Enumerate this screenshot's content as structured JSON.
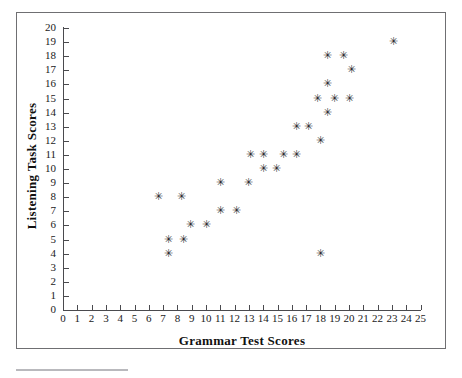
{
  "figure": {
    "background_color": "#ffffff",
    "frame_color": "#6f6f72",
    "axis_color": "#4a4a4e",
    "marker_color": "#2b2b2e",
    "marker_glyph": "✳"
  },
  "chart_data": {
    "type": "scatter",
    "title": "",
    "xlabel": "Grammar Test Scores",
    "ylabel": "Listening Task Scores",
    "xlim": [
      0,
      25
    ],
    "ylim": [
      0,
      20
    ],
    "xticks": [
      0,
      1,
      2,
      3,
      4,
      5,
      6,
      7,
      8,
      9,
      10,
      11,
      12,
      13,
      14,
      15,
      16,
      17,
      18,
      19,
      20,
      21,
      22,
      23,
      24,
      25
    ],
    "yticks": [
      0,
      1,
      2,
      3,
      4,
      5,
      6,
      7,
      8,
      9,
      10,
      11,
      12,
      13,
      14,
      15,
      16,
      17,
      18,
      19,
      20
    ],
    "xtick_labels": [
      "0",
      "1",
      "2",
      "3",
      "4",
      "5",
      "6",
      "7",
      "8",
      "9",
      "10",
      "11",
      "12",
      "13",
      "14",
      "15",
      "16",
      "17",
      "18",
      "19",
      "20",
      "21",
      "22",
      "23",
      "24",
      "25"
    ],
    "ytick_labels": [
      "0",
      "1",
      "2",
      "3",
      "4",
      "5",
      "6",
      "7",
      "8",
      "9",
      "10",
      "11",
      "12",
      "13",
      "14",
      "15",
      "16",
      "17",
      "18",
      "19",
      "20"
    ],
    "grid": false,
    "legend": null,
    "marker": "asterisk",
    "points": [
      {
        "x": 6.7,
        "y": 8.0
      },
      {
        "x": 7.4,
        "y": 5.0
      },
      {
        "x": 7.4,
        "y": 4.0
      },
      {
        "x": 8.3,
        "y": 8.0
      },
      {
        "x": 8.4,
        "y": 5.0
      },
      {
        "x": 8.9,
        "y": 6.0
      },
      {
        "x": 10.0,
        "y": 6.0
      },
      {
        "x": 11.0,
        "y": 9.0
      },
      {
        "x": 11.0,
        "y": 7.0
      },
      {
        "x": 12.1,
        "y": 7.0
      },
      {
        "x": 13.0,
        "y": 9.0
      },
      {
        "x": 13.1,
        "y": 11.0
      },
      {
        "x": 14.0,
        "y": 11.0
      },
      {
        "x": 14.0,
        "y": 10.0
      },
      {
        "x": 14.9,
        "y": 10.0
      },
      {
        "x": 15.4,
        "y": 11.0
      },
      {
        "x": 16.3,
        "y": 11.0
      },
      {
        "x": 16.3,
        "y": 13.0
      },
      {
        "x": 17.2,
        "y": 13.0
      },
      {
        "x": 18.0,
        "y": 12.0
      },
      {
        "x": 18.5,
        "y": 14.0
      },
      {
        "x": 18.0,
        "y": 4.0
      },
      {
        "x": 17.8,
        "y": 15.0
      },
      {
        "x": 19.0,
        "y": 15.0
      },
      {
        "x": 20.0,
        "y": 15.0
      },
      {
        "x": 18.5,
        "y": 16.0
      },
      {
        "x": 18.5,
        "y": 18.0
      },
      {
        "x": 19.6,
        "y": 18.0
      },
      {
        "x": 20.2,
        "y": 17.0
      },
      {
        "x": 23.1,
        "y": 19.0
      }
    ]
  }
}
